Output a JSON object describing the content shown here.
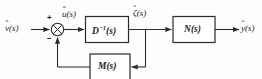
{
  "figure": {
    "type": "control-system-block-diagram",
    "width": 262,
    "height": 79,
    "background_color": "#fdfdfd",
    "line_color": "#2b2b2b",
    "text_color": "#1a1a1a"
  },
  "signals": {
    "input": {
      "base": "v",
      "accent": "ˆ",
      "arg": "(s)",
      "full": "v̂(s)"
    },
    "control": {
      "base": "u",
      "accent": "ˆ",
      "arg": "(s)",
      "full": "û(s)"
    },
    "state": {
      "base": "ζ",
      "accent": "ˆ",
      "arg": "(s)",
      "full": "ζ̂(s)"
    },
    "output": {
      "base": "y",
      "accent": "ˆ",
      "arg": "(s)",
      "full": "ŷ(s)"
    }
  },
  "summing_junction": {
    "name": "summing-junction",
    "glyph": "⊗",
    "plus_sign": "+",
    "minus_sign": "−"
  },
  "blocks": [
    {
      "id": "d-inverse",
      "base": "D",
      "exponent": "−1",
      "arg": "(s)",
      "label": "D⁻¹(s)"
    },
    {
      "id": "n",
      "base": "N",
      "exponent": "",
      "arg": "(s)",
      "label": "N(s)"
    },
    {
      "id": "m",
      "base": "M",
      "exponent": "",
      "arg": "(s)",
      "label": "M(s)"
    }
  ]
}
